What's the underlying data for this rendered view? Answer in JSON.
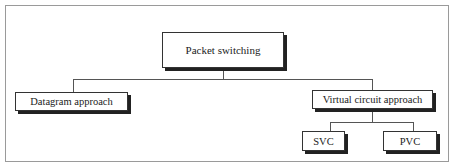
{
  "diagram": {
    "type": "hierarchy",
    "root": {
      "label": "Packet switching",
      "children": [
        {
          "label": "Datagram approach",
          "children": []
        },
        {
          "label": "Virtual circuit approach",
          "children": [
            {
              "label": "SVC"
            },
            {
              "label": "PVC"
            }
          ]
        }
      ]
    }
  },
  "nodes": {
    "root": "Packet switching",
    "datagram": "Datagram approach",
    "virtual_circuit": "Virtual circuit approach",
    "svc": "SVC",
    "pvc": "PVC"
  }
}
